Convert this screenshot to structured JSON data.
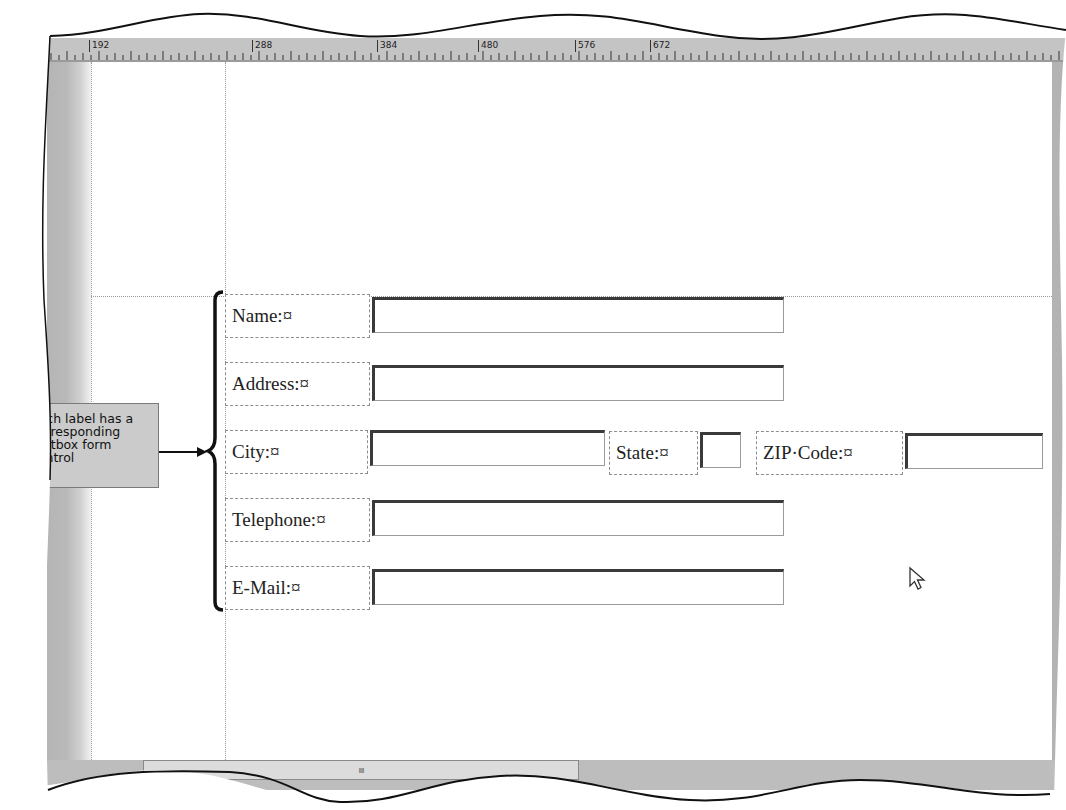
{
  "ruler": {
    "unit": "pixels",
    "labels": [
      "192",
      "288",
      "384",
      "480",
      "576",
      "672"
    ]
  },
  "form": {
    "rows": [
      {
        "label": "Name:¤",
        "field": "name-textbox",
        "value": ""
      },
      {
        "label": "Address:¤",
        "field": "address-textbox",
        "value": ""
      },
      {
        "label": "City:¤",
        "field": "city-textbox",
        "value": ""
      },
      {
        "label": "Telephone:¤",
        "field": "telephone-textbox",
        "value": ""
      },
      {
        "label": "E-Mail:¤",
        "field": "email-textbox",
        "value": ""
      }
    ],
    "city_row_extra": [
      {
        "label": "State:¤",
        "field": "state-textbox",
        "value": ""
      },
      {
        "label": "ZIP·Code:¤",
        "field": "zip-textbox",
        "value": ""
      }
    ]
  },
  "callout": {
    "text": "each label has a corresponding textbox form control"
  },
  "scrollbar": {
    "grip": "IIII"
  },
  "colors": {
    "chrome_gray": "#bdbdbd",
    "page_bg": "#ffffff",
    "callout_bg": "#cbcbcb",
    "textbox_border": "#3a3a3a"
  }
}
